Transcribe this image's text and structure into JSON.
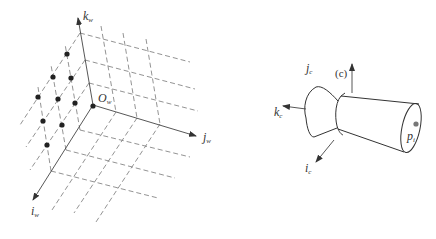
{
  "world_frame": {
    "origin_label": "O",
    "origin_sub": "w",
    "axes": [
      {
        "name": "k",
        "sub": "w",
        "direction": "up"
      },
      {
        "name": "j",
        "sub": "w",
        "direction": "right"
      },
      {
        "name": "i",
        "sub": "w",
        "direction": "down-left"
      }
    ],
    "grid_style": "dashed",
    "point_count": 10
  },
  "camera_frame": {
    "panel_label": "(c)",
    "axes": [
      {
        "name": "j",
        "sub": "c",
        "direction": "up"
      },
      {
        "name": "k",
        "sub": "c",
        "direction": "left"
      },
      {
        "name": "i",
        "sub": "c",
        "direction": "down-left"
      }
    ],
    "image_point_label": "p",
    "image_point_sub": "i"
  },
  "colors": {
    "line": "#555555",
    "dashed": "#777777",
    "dot": "#222222",
    "image_point": "#777777"
  }
}
